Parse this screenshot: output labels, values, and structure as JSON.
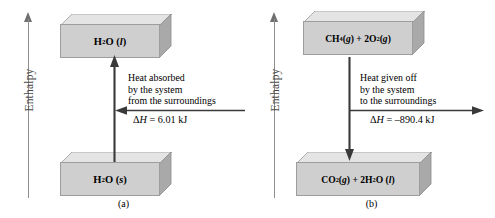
{
  "figure": {
    "type": "enthalpy-diagram",
    "background": "#ffffff",
    "box_face_color": "#cfcfcf",
    "box_top_color": "#e2e2e2",
    "box_side_color": "#a8a8a8",
    "axis_color": "#8e8e8e"
  },
  "panels": [
    {
      "id": "a",
      "caption": "(a)",
      "axis_label": "Enthalpy",
      "top_box": {
        "formula_html": "H<sub>2</sub>O (<i>l</i>)",
        "plain": "H2O (l)"
      },
      "bottom_box": {
        "formula_html": "H<sub>2</sub>O (<i>s</i>)",
        "plain": "H2O (s)"
      },
      "vertical_arrow_direction": "up",
      "horizontal_arrow_direction": "left",
      "note_lines": [
        "Heat absorbed",
        "by the system",
        "from the surroundings"
      ],
      "delta_h_html": "Δ<i>H</i> = 6.01 kJ",
      "delta_h_value": 6.01,
      "delta_h_units": "kJ",
      "delta_h_sign": "positive",
      "process": "endothermic"
    },
    {
      "id": "b",
      "caption": "(b)",
      "axis_label": "Enthalpy",
      "top_box": {
        "formula_html": "CH<sub>4</sub> (<i>g</i>) + 2O<sub>2</sub> (<i>g</i>)",
        "plain": "CH4 (g) + 2O2 (g)"
      },
      "bottom_box": {
        "formula_html": "CO<sub>2</sub> (<i>g</i>) + 2H<sub>2</sub>O (<i>l</i>)",
        "plain": "CO2 (g) + 2H2O (l)"
      },
      "vertical_arrow_direction": "down",
      "horizontal_arrow_direction": "right",
      "note_lines": [
        "Heat given off",
        "by the system",
        "to the surroundings"
      ],
      "delta_h_html": "Δ<i>H</i> = –890.4 kJ",
      "delta_h_value": -890.4,
      "delta_h_units": "kJ",
      "delta_h_sign": "negative",
      "process": "exothermic"
    }
  ]
}
